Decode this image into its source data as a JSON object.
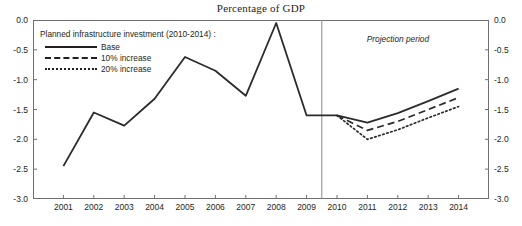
{
  "title": "Percentage of GDP",
  "annotations": {
    "projection_label": "Projection period",
    "legend_header": "Planned infrastructure investment (2010-2014) :"
  },
  "chart_data": {
    "type": "line",
    "title": "Percentage of GDP",
    "xlabel": "",
    "ylabel": "",
    "x": [
      "2001",
      "2002",
      "2003",
      "2004",
      "2005",
      "2006",
      "2007",
      "2008",
      "2009",
      "2010",
      "2011",
      "2012",
      "2013",
      "2014"
    ],
    "ylim": [
      -3.0,
      0.0
    ],
    "yticks": [
      "0.0",
      "-0.5",
      "-1.0",
      "-1.5",
      "-2.0",
      "-2.5",
      "-3.0"
    ],
    "ytick_values": [
      0.0,
      -0.5,
      -1.0,
      -1.5,
      -2.0,
      -2.5,
      -3.0
    ],
    "grid": false,
    "legend_position": "upper-left",
    "series": [
      {
        "name": "Base",
        "values": [
          -2.45,
          -1.55,
          -1.77,
          -1.32,
          -0.62,
          -0.85,
          -1.27,
          -0.05,
          -1.6,
          -1.6,
          -1.72,
          -1.56,
          -1.36,
          -1.15
        ],
        "style": "solid"
      },
      {
        "name": "10% increase",
        "values": [
          null,
          null,
          null,
          null,
          null,
          null,
          null,
          null,
          null,
          -1.6,
          -1.85,
          -1.7,
          -1.5,
          -1.3
        ],
        "style": "dashed"
      },
      {
        "name": "20% increase",
        "values": [
          null,
          null,
          null,
          null,
          null,
          null,
          null,
          null,
          null,
          -1.6,
          -2.0,
          -1.84,
          -1.64,
          -1.45
        ],
        "style": "dotted"
      }
    ],
    "projection_start": "2010",
    "projection_divider_x": "between 2009 and 2010"
  }
}
